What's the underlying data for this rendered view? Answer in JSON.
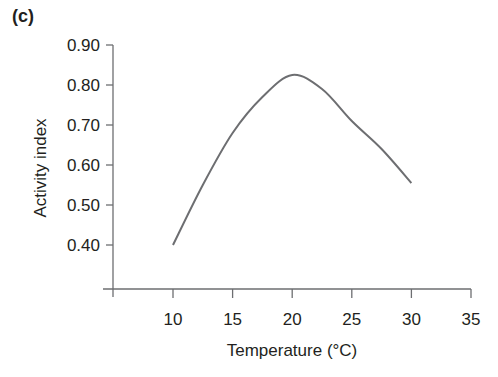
{
  "panel_label": "(c)",
  "chart_data": {
    "type": "line",
    "title": "",
    "xlabel": "Temperature (°C)",
    "ylabel": "Activity index",
    "xlim": [
      5,
      35
    ],
    "ylim": [
      0.3,
      0.9
    ],
    "x_ticks": [
      10,
      15,
      20,
      25,
      30,
      35
    ],
    "x_tick_labels": [
      "10",
      "15",
      "20",
      "25",
      "30",
      "35"
    ],
    "y_ticks": [
      0.4,
      0.5,
      0.6,
      0.7,
      0.8,
      0.9
    ],
    "y_tick_labels": [
      "0.40",
      "0.50",
      "0.60",
      "0.70",
      "0.80",
      "0.90"
    ],
    "grid": false,
    "legend": null,
    "series": [
      {
        "name": "Activity index",
        "color": "#6d6e71",
        "x": [
          10,
          12.5,
          15,
          17.5,
          20,
          22.5,
          25,
          27.5,
          30
        ],
        "y": [
          0.4,
          0.55,
          0.68,
          0.77,
          0.825,
          0.79,
          0.71,
          0.64,
          0.555
        ]
      }
    ]
  }
}
